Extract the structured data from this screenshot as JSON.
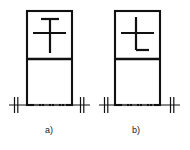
{
  "diagram": {
    "title": "",
    "background_color": "#ffffff",
    "line_color": "#111111",
    "centerline_color": "#9a9a9a",
    "figures": [
      {
        "id": "figure-a",
        "label": "a)",
        "label_x": 49,
        "label_y": 133,
        "outline": {
          "x": 27,
          "y": 11,
          "width": 45,
          "height": 94
        },
        "divider_y": 59,
        "symbol": {
          "name": "cross-with-top-bar-symbol",
          "description": "vertical stroke crossed by a horizontal bar, with a short horizontal cap bar across the top of the vertical stroke",
          "vertical": {
            "x": 50,
            "y1": 19,
            "y2": 53
          },
          "crossbar": {
            "y": 33,
            "x1": 33,
            "x2": 66
          },
          "topbar": {
            "y": 19,
            "x1": 41,
            "x2": 59
          }
        }
      },
      {
        "id": "figure-b",
        "label": "b)",
        "label_x": 136,
        "label_y": 133,
        "outline": {
          "x": 115,
          "y": 11,
          "width": 45,
          "height": 94
        },
        "divider_y": 59,
        "symbol": {
          "name": "cross-with-bottom-foot-symbol",
          "description": "vertical stroke crossed by a horizontal bar, with a short horizontal foot extending to the right at the bottom of the vertical stroke",
          "vertical": {
            "x": 136,
            "y1": 17,
            "y2": 50
          },
          "crossbar": {
            "y": 33,
            "x1": 121,
            "x2": 154
          },
          "footbar": {
            "y": 50,
            "x1": 136,
            "x2": 149
          }
        }
      }
    ],
    "ground_lines": [
      {
        "name": "ground-line-a",
        "y": 105,
        "x1": 9,
        "x2": 90,
        "break_marks": [
          {
            "name": "break-mark-left-a",
            "x": 16
          },
          {
            "name": "break-mark-right-a",
            "x": 82
          }
        ]
      },
      {
        "name": "ground-line-b",
        "y": 105,
        "x1": 99,
        "x2": 180,
        "break_marks": [
          {
            "name": "break-mark-left-b",
            "x": 106
          },
          {
            "name": "break-mark-right-b",
            "x": 172
          }
        ]
      }
    ],
    "centerlines": [
      {
        "name": "centerline-a",
        "y": 105,
        "x1": 34,
        "x2": 66
      },
      {
        "name": "centerline-b",
        "y": 105,
        "x1": 122,
        "x2": 154
      }
    ]
  }
}
